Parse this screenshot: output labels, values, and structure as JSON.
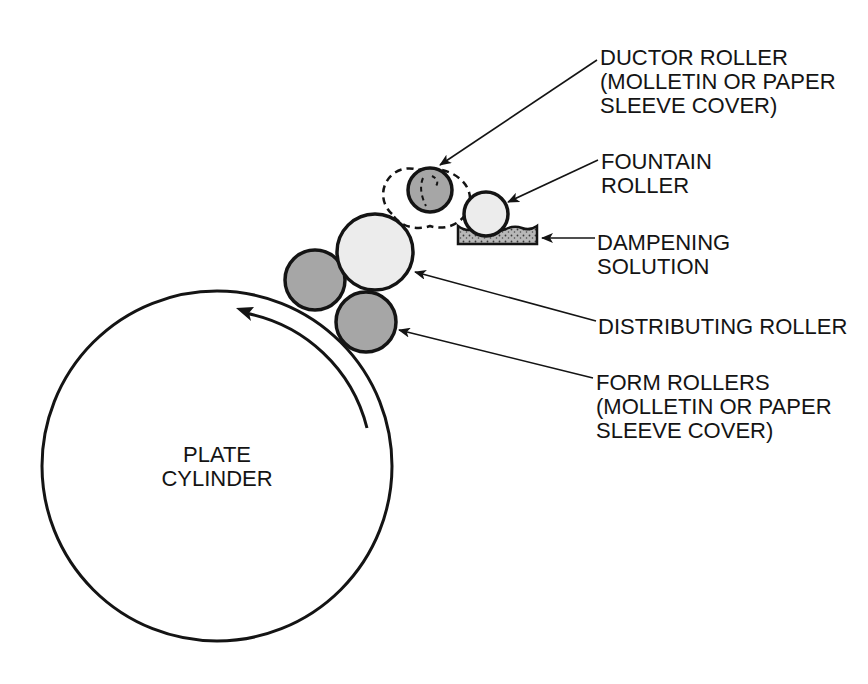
{
  "diagram": {
    "type": "offset-press dampening system",
    "colors": {
      "stroke": "#141414",
      "form_roller_fill": "#a6a6a6",
      "ductor_roller_fill": "#a6a6a6",
      "distributing_roller_fill": "#ececec",
      "fountain_roller_fill": "#ececec",
      "solution_fill": "#b8b8b8",
      "background": "#ffffff"
    },
    "plate_cylinder": {
      "label_line1": "PLATE",
      "label_line2": "CYLINDER",
      "rotation": "counter-clockwise"
    },
    "labels": {
      "ductor": {
        "line1": "DUCTOR ROLLER",
        "line2": "(MOLLETIN OR PAPER",
        "line3": "SLEEVE COVER)"
      },
      "fountain": {
        "line1": "FOUNTAIN",
        "line2": "ROLLER"
      },
      "dampening": {
        "line1": "DAMPENING",
        "line2": "SOLUTION"
      },
      "distributing": {
        "line1": "DISTRIBUTING ROLLER"
      },
      "form": {
        "line1": "FORM ROLLERS",
        "line2": "(MOLLETIN OR PAPER",
        "line3": "SLEEVE COVER)"
      }
    }
  }
}
